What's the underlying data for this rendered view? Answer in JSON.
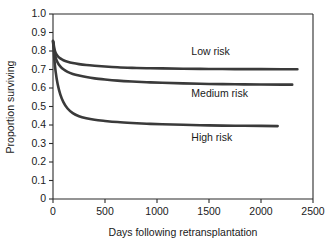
{
  "chart_data": {
    "type": "line",
    "title": "",
    "xlabel": "Days following retransplantation",
    "ylabel": "Proportion surviving",
    "xlim": [
      0,
      2500
    ],
    "ylim": [
      0,
      1.0
    ],
    "grid": false,
    "legend_position": "inline-annotations",
    "xticks": [
      "0",
      "500",
      "1000",
      "1500",
      "2000",
      "2500"
    ],
    "xtick_values": [
      0,
      500,
      1000,
      1500,
      2000,
      2500
    ],
    "yticks": [
      "0",
      "0.1",
      "0.2",
      "0.3",
      "0.4",
      "0.5",
      "0.6",
      "0.7",
      "0.8",
      "0.9",
      "1.0"
    ],
    "ytick_values": [
      0,
      0.1,
      0.2,
      0.3,
      0.4,
      0.5,
      0.6,
      0.7,
      0.8,
      0.9,
      1.0
    ],
    "series": [
      {
        "name": "Low risk",
        "label": "Low risk",
        "color": "#3a3a3a",
        "label_x": 1330,
        "label_y": 0.795,
        "x": [
          0,
          5,
          12,
          25,
          45,
          70,
          100,
          140,
          190,
          250,
          320,
          400,
          500,
          620,
          760,
          900,
          1050,
          1250,
          1500,
          1750,
          2000,
          2200,
          2350
        ],
        "y": [
          0.855,
          0.845,
          0.815,
          0.79,
          0.772,
          0.76,
          0.75,
          0.742,
          0.735,
          0.729,
          0.724,
          0.72,
          0.716,
          0.712,
          0.709,
          0.707,
          0.706,
          0.704,
          0.703,
          0.702,
          0.702,
          0.701,
          0.701
        ]
      },
      {
        "name": "Medium risk",
        "label": "Medium risk",
        "color": "#3a3a3a",
        "label_x": 1330,
        "label_y": 0.565,
        "x": [
          0,
          5,
          12,
          25,
          45,
          70,
          100,
          140,
          190,
          250,
          320,
          400,
          500,
          620,
          760,
          900,
          1050,
          1250,
          1500,
          1750,
          2000,
          2200,
          2300
        ],
        "y": [
          0.852,
          0.838,
          0.8,
          0.765,
          0.737,
          0.717,
          0.701,
          0.687,
          0.676,
          0.667,
          0.659,
          0.652,
          0.646,
          0.64,
          0.635,
          0.631,
          0.628,
          0.625,
          0.622,
          0.62,
          0.619,
          0.618,
          0.618
        ]
      },
      {
        "name": "High risk",
        "label": "High risk",
        "color": "#3a3a3a",
        "label_x": 1330,
        "label_y": 0.33,
        "x": [
          0,
          5,
          12,
          25,
          45,
          70,
          100,
          140,
          190,
          250,
          320,
          400,
          500,
          620,
          760,
          900,
          1050,
          1250,
          1500,
          1750,
          2000,
          2160
        ],
        "y": [
          0.85,
          0.82,
          0.76,
          0.69,
          0.62,
          0.566,
          0.524,
          0.489,
          0.464,
          0.447,
          0.436,
          0.428,
          0.422,
          0.416,
          0.411,
          0.407,
          0.404,
          0.401,
          0.398,
          0.396,
          0.395,
          0.394
        ]
      }
    ]
  }
}
